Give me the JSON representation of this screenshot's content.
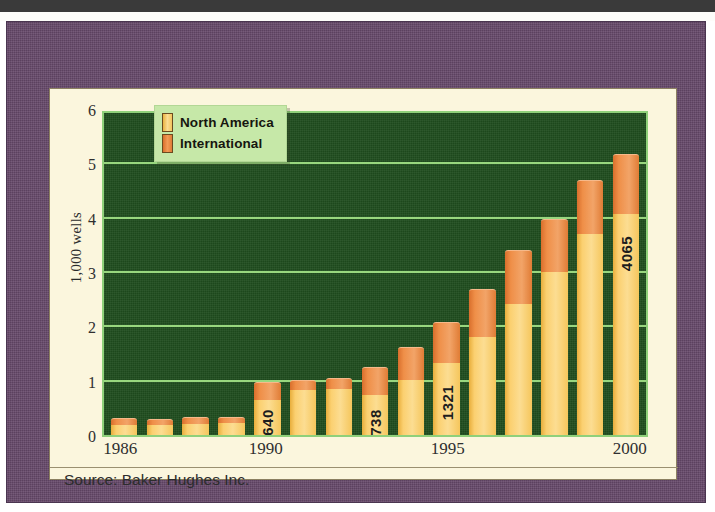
{
  "figure": {
    "panel_background": "#fbf6dd",
    "frame_color": "#66496a",
    "plot_background": "#1f4d1e"
  },
  "legend": {
    "position": "top-left-inside",
    "background": "#c6e8a8",
    "entries": [
      {
        "label": "North America",
        "color": "#f2c45c",
        "swatch": "legend-swatch-north-america"
      },
      {
        "label": "International",
        "color": "#e07c35",
        "swatch": "legend-swatch-international"
      }
    ]
  },
  "source": {
    "text": "Source: Baker Hughes Inc."
  },
  "chart_data": {
    "type": "bar",
    "subtype": "stacked-vertical",
    "title": "",
    "subtitle": "",
    "xlabel": "",
    "ylabel": "1,000 wells",
    "ylim": [
      0,
      6
    ],
    "yticks": [
      0,
      1,
      2,
      3,
      4,
      5,
      6
    ],
    "ytick_labels": [
      "0",
      "1",
      "2",
      "3",
      "4",
      "5",
      "6"
    ],
    "grid": true,
    "grid_axis": "y",
    "grid_color": "#9ede84",
    "legend_position": "upper left",
    "x": [
      1986,
      1987,
      1988,
      1989,
      1990,
      1991,
      1992,
      1993,
      1994,
      1995,
      1996,
      1997,
      1998,
      1999,
      2000
    ],
    "categories": [
      "1986",
      "1987",
      "1988",
      "1989",
      "1990",
      "1991",
      "1992",
      "1993",
      "1994",
      "1995",
      "1996",
      "1997",
      "1998",
      "1999",
      "2000"
    ],
    "xtick_labels_shown": [
      "1986",
      "1990",
      "1995",
      "2000"
    ],
    "xtick_label_positions": [
      1986,
      1990,
      1995,
      2000
    ],
    "series": [
      {
        "name": "North America",
        "color": "#f2c45c",
        "values": [
          0.19,
          0.18,
          0.21,
          0.22,
          0.64,
          0.82,
          0.84,
          0.738,
          1.02,
          1.321,
          1.8,
          2.41,
          3.0,
          3.7,
          4.065
        ]
      },
      {
        "name": "International",
        "color": "#e07c35",
        "values": [
          0.1,
          0.09,
          0.1,
          0.1,
          0.31,
          0.18,
          0.2,
          0.5,
          0.58,
          0.74,
          0.86,
          0.98,
          0.95,
          0.97,
          1.08
        ]
      }
    ],
    "totals": [
      0.29,
      0.27,
      0.31,
      0.32,
      0.95,
      1.0,
      1.04,
      1.24,
      1.6,
      2.06,
      2.66,
      3.39,
      3.95,
      4.67,
      5.15
    ],
    "data_labels": [
      {
        "category": "1990",
        "text": "640",
        "series": "North America",
        "orientation": "vertical"
      },
      {
        "category": "1993",
        "text": "738",
        "series": "North America",
        "orientation": "vertical"
      },
      {
        "category": "1995",
        "text": "1321",
        "series": "North America",
        "orientation": "vertical"
      },
      {
        "category": "2000",
        "text": "4065",
        "series": "North America",
        "orientation": "vertical"
      }
    ]
  }
}
